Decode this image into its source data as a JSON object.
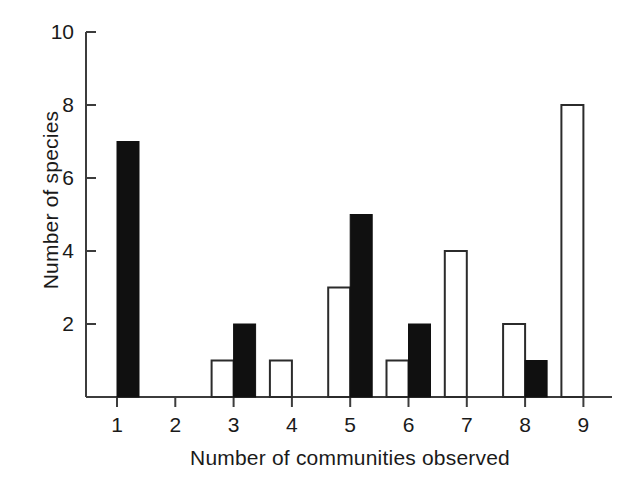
{
  "chart_data": {
    "type": "bar",
    "title": "",
    "subtitle": "",
    "xlabel": "Number of communities observed",
    "ylabel": "Number of species",
    "categories": [
      "1",
      "2",
      "3",
      "4",
      "5",
      "6",
      "7",
      "8",
      "9"
    ],
    "xlim": [
      0.4,
      9.8
    ],
    "ylim": [
      0,
      10
    ],
    "yticks": [
      2,
      4,
      6,
      8,
      10
    ],
    "xticks": [
      1,
      2,
      3,
      4,
      5,
      6,
      7,
      8,
      9
    ],
    "grid": false,
    "legend_position": "none",
    "series": [
      {
        "name": "open-bars",
        "style": "open",
        "fill": "#ffffff",
        "stroke": "#2b2b2b",
        "offset": "left-of-tick",
        "values": [
          0,
          0,
          1,
          1,
          3,
          1,
          4,
          2,
          8
        ]
      },
      {
        "name": "filled-bars",
        "style": "filled",
        "fill": "#101010",
        "stroke": "#101010",
        "offset": "right-of-tick",
        "values": [
          7,
          0,
          2,
          0,
          5,
          2,
          0,
          1,
          0
        ]
      }
    ],
    "annotations": []
  },
  "axes": {
    "y_tick_labels": [
      "10",
      "8",
      "6",
      "4",
      "2"
    ],
    "x_tick_labels": [
      "1",
      "2",
      "3",
      "4",
      "5",
      "6",
      "7",
      "8",
      "9"
    ]
  },
  "colors": {
    "background": "#ffffff",
    "axis": "#3c3c3c",
    "text": "#1a1a1a",
    "bar_filled": "#101010",
    "bar_open_fill": "#ffffff",
    "bar_open_stroke": "#2b2b2b"
  }
}
